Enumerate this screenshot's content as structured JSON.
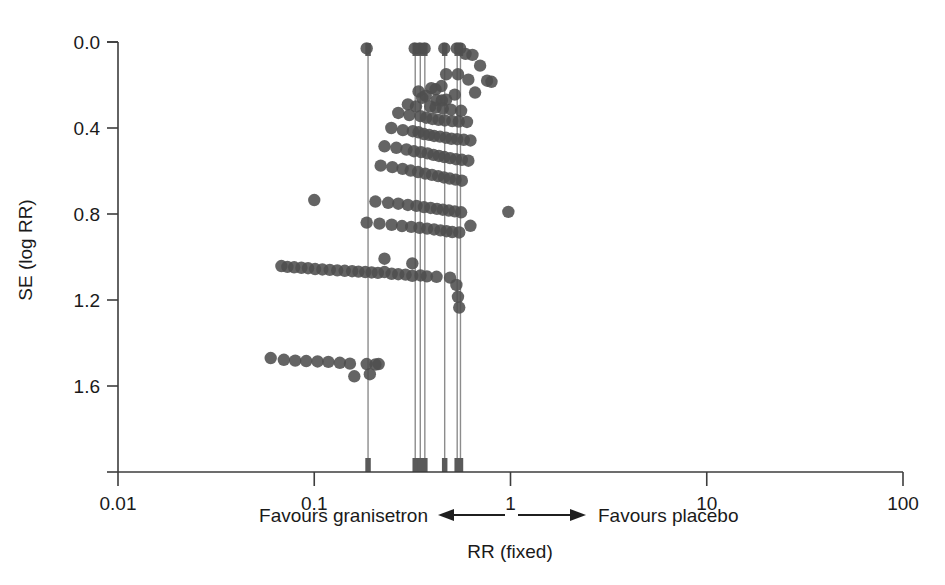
{
  "figure": {
    "name": "funnel-plot",
    "background_color": "#ffffff",
    "dot_color": "#4f4f4f",
    "line_color": "#8c8c8c",
    "axis_color": "#3d3d3d",
    "width": 945,
    "height": 585
  },
  "axes": {
    "x": {
      "label": "RR (fixed)",
      "scale": "log10",
      "ticks": [
        "0.01",
        "0.1",
        "1",
        "10",
        "100"
      ],
      "tick_values": [
        0.01,
        0.1,
        1,
        10,
        100
      ],
      "min": 0.01,
      "max": 100
    },
    "y": {
      "label": "SE (log RR)",
      "scale": "linear",
      "ticks": [
        "0.0",
        "0.4",
        "0.8",
        "1.2",
        "1.6"
      ],
      "tick_values": [
        0.0,
        0.4,
        0.8,
        1.2,
        1.6
      ],
      "min": 0.0,
      "max": 2.0,
      "inverted": true
    }
  },
  "caption": {
    "left_text": "Favours granisetron",
    "right_text": "Favours placebo",
    "left_arrow": "left-arrow-icon",
    "right_arrow": "right-arrow-icon",
    "axis_title": "RR (fixed)"
  },
  "chart_data": {
    "type": "scatter",
    "title": "",
    "xlabel": "RR (fixed)",
    "ylabel": "SE (log RR)",
    "xscale": "log",
    "xlim": [
      0.01,
      100
    ],
    "ylim": [
      0.0,
      2.0
    ],
    "y_inverted": true,
    "grid": false,
    "legend": null,
    "annotations": [
      "Favours granisetron",
      "Favours placebo"
    ],
    "reference_lines": {
      "orientation": "vertical",
      "description": "Vertical marker lines for pooled summary estimates, drawn from top of plot to the x-axis, each capped with a thick tick.",
      "x": [
        0.188,
        0.327,
        0.347,
        0.366,
        0.462,
        0.535,
        0.556
      ]
    },
    "series": [
      {
        "name": "Studies",
        "marker": "filled-circle",
        "color": "#4f4f4f",
        "points": [
          [
            0.185,
            0.03
          ],
          [
            0.325,
            0.03
          ],
          [
            0.345,
            0.03
          ],
          [
            0.365,
            0.03
          ],
          [
            0.46,
            0.03
          ],
          [
            0.533,
            0.03
          ],
          [
            0.554,
            0.03
          ],
          [
            0.59,
            0.055
          ],
          [
            0.64,
            0.06
          ],
          [
            0.7,
            0.11
          ],
          [
            0.54,
            0.15
          ],
          [
            0.47,
            0.15
          ],
          [
            0.61,
            0.175
          ],
          [
            0.76,
            0.18
          ],
          [
            0.8,
            0.185
          ],
          [
            0.445,
            0.205
          ],
          [
            0.395,
            0.215
          ],
          [
            0.415,
            0.22
          ],
          [
            0.34,
            0.23
          ],
          [
            0.66,
            0.235
          ],
          [
            0.52,
            0.245
          ],
          [
            0.37,
            0.25
          ],
          [
            0.355,
            0.26
          ],
          [
            0.42,
            0.27
          ],
          [
            0.447,
            0.272
          ],
          [
            0.47,
            0.268
          ],
          [
            0.3,
            0.29
          ],
          [
            0.33,
            0.3
          ],
          [
            0.39,
            0.3
          ],
          [
            0.415,
            0.305
          ],
          [
            0.452,
            0.31
          ],
          [
            0.497,
            0.315
          ],
          [
            0.56,
            0.32
          ],
          [
            0.268,
            0.33
          ],
          [
            0.305,
            0.34
          ],
          [
            0.348,
            0.345
          ],
          [
            0.372,
            0.352
          ],
          [
            0.4,
            0.358
          ],
          [
            0.43,
            0.362
          ],
          [
            0.462,
            0.365
          ],
          [
            0.505,
            0.368
          ],
          [
            0.545,
            0.37
          ],
          [
            0.6,
            0.372
          ],
          [
            0.247,
            0.4
          ],
          [
            0.283,
            0.41
          ],
          [
            0.318,
            0.415
          ],
          [
            0.34,
            0.42
          ],
          [
            0.362,
            0.428
          ],
          [
            0.385,
            0.432
          ],
          [
            0.408,
            0.437
          ],
          [
            0.437,
            0.44
          ],
          [
            0.468,
            0.445
          ],
          [
            0.5,
            0.45
          ],
          [
            0.535,
            0.452
          ],
          [
            0.578,
            0.455
          ],
          [
            0.625,
            0.458
          ],
          [
            0.228,
            0.485
          ],
          [
            0.262,
            0.492
          ],
          [
            0.295,
            0.5
          ],
          [
            0.322,
            0.508
          ],
          [
            0.35,
            0.512
          ],
          [
            0.378,
            0.518
          ],
          [
            0.405,
            0.525
          ],
          [
            0.432,
            0.53
          ],
          [
            0.46,
            0.535
          ],
          [
            0.492,
            0.54
          ],
          [
            0.527,
            0.545
          ],
          [
            0.565,
            0.548
          ],
          [
            0.61,
            0.552
          ],
          [
            0.218,
            0.575
          ],
          [
            0.25,
            0.582
          ],
          [
            0.282,
            0.59
          ],
          [
            0.31,
            0.598
          ],
          [
            0.338,
            0.605
          ],
          [
            0.368,
            0.612
          ],
          [
            0.398,
            0.618
          ],
          [
            0.428,
            0.624
          ],
          [
            0.458,
            0.63
          ],
          [
            0.49,
            0.635
          ],
          [
            0.525,
            0.64
          ],
          [
            0.565,
            0.645
          ],
          [
            0.1,
            0.735
          ],
          [
            0.205,
            0.742
          ],
          [
            0.238,
            0.748
          ],
          [
            0.268,
            0.752
          ],
          [
            0.3,
            0.758
          ],
          [
            0.332,
            0.762
          ],
          [
            0.362,
            0.768
          ],
          [
            0.392,
            0.772
          ],
          [
            0.422,
            0.776
          ],
          [
            0.452,
            0.78
          ],
          [
            0.485,
            0.784
          ],
          [
            0.52,
            0.788
          ],
          [
            0.56,
            0.792
          ],
          [
            0.975,
            0.79
          ],
          [
            0.185,
            0.84
          ],
          [
            0.215,
            0.845
          ],
          [
            0.248,
            0.85
          ],
          [
            0.28,
            0.856
          ],
          [
            0.312,
            0.86
          ],
          [
            0.344,
            0.864
          ],
          [
            0.376,
            0.868
          ],
          [
            0.408,
            0.872
          ],
          [
            0.44,
            0.876
          ],
          [
            0.472,
            0.88
          ],
          [
            0.505,
            0.884
          ],
          [
            0.548,
            0.886
          ],
          [
            0.625,
            0.855
          ],
          [
            0.068,
            1.042
          ],
          [
            0.073,
            1.046
          ],
          [
            0.079,
            1.048
          ],
          [
            0.086,
            1.05
          ],
          [
            0.093,
            1.052
          ],
          [
            0.101,
            1.056
          ],
          [
            0.11,
            1.058
          ],
          [
            0.12,
            1.06
          ],
          [
            0.131,
            1.062
          ],
          [
            0.143,
            1.064
          ],
          [
            0.156,
            1.066
          ],
          [
            0.168,
            1.068
          ],
          [
            0.182,
            1.07
          ],
          [
            0.196,
            1.072
          ],
          [
            0.211,
            1.074
          ],
          [
            0.228,
            1.07
          ],
          [
            0.228,
            1.008
          ],
          [
            0.248,
            1.078
          ],
          [
            0.268,
            1.08
          ],
          [
            0.292,
            1.082
          ],
          [
            0.316,
            1.03
          ],
          [
            0.316,
            1.088
          ],
          [
            0.348,
            1.086
          ],
          [
            0.375,
            1.09
          ],
          [
            0.42,
            1.092
          ],
          [
            0.492,
            1.096
          ],
          [
            0.53,
            1.13
          ],
          [
            0.54,
            1.185
          ],
          [
            0.548,
            1.235
          ],
          [
            0.06,
            1.47
          ],
          [
            0.07,
            1.478
          ],
          [
            0.08,
            1.482
          ],
          [
            0.091,
            1.484
          ],
          [
            0.104,
            1.486
          ],
          [
            0.118,
            1.488
          ],
          [
            0.135,
            1.492
          ],
          [
            0.152,
            1.496
          ],
          [
            0.16,
            1.555
          ],
          [
            0.185,
            1.498
          ],
          [
            0.192,
            1.545
          ],
          [
            0.205,
            1.5
          ],
          [
            0.213,
            1.498
          ]
        ]
      }
    ]
  }
}
